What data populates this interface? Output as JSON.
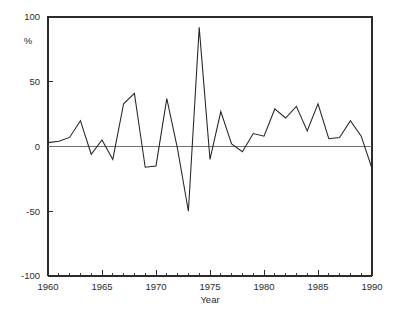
{
  "figure": {
    "background_color": "#ffffff",
    "line_color": "#242424",
    "axis_color": "#2b2b2b",
    "zero_line_color": "#6f6f6f"
  },
  "chart_data": {
    "type": "line",
    "title": "",
    "xlabel": "Year",
    "ylabel": "%",
    "xlim": [
      1960,
      1990
    ],
    "ylim": [
      -100,
      100
    ],
    "grid": false,
    "legend": null,
    "x_tick_labels": [
      "1960",
      "1965",
      "1970",
      "1975",
      "1980",
      "1985",
      "1990"
    ],
    "x_tick_values": [
      1960,
      1965,
      1970,
      1975,
      1980,
      1985,
      1990
    ],
    "x_minor_tick_step": 1,
    "y_tick_labels": [
      "100",
      "50",
      "0",
      "-50",
      "-100"
    ],
    "y_tick_values": [
      100,
      50,
      0,
      -50,
      -100
    ],
    "x": [
      1960,
      1961,
      1962,
      1963,
      1964,
      1965,
      1966,
      1967,
      1968,
      1969,
      1970,
      1971,
      1972,
      1973,
      1974,
      1975,
      1976,
      1977,
      1978,
      1979,
      1980,
      1981,
      1982,
      1983,
      1984,
      1985,
      1986,
      1987,
      1988,
      1989,
      1990
    ],
    "values": [
      3,
      4,
      7,
      20,
      -6,
      5,
      -10,
      33,
      41,
      -16,
      -15,
      37,
      -2,
      -50,
      92,
      -10,
      27,
      2,
      -4,
      10,
      8,
      29,
      22,
      31,
      12,
      33,
      6,
      7,
      20,
      8,
      -17
    ],
    "series": [
      {
        "name": "percent-change",
        "values": [
          3,
          4,
          7,
          20,
          -6,
          5,
          -10,
          33,
          41,
          -16,
          -15,
          37,
          -2,
          -50,
          92,
          -10,
          27,
          2,
          -4,
          10,
          8,
          29,
          22,
          31,
          12,
          33,
          6,
          7,
          20,
          8,
          -17
        ]
      }
    ],
    "annotations": []
  }
}
